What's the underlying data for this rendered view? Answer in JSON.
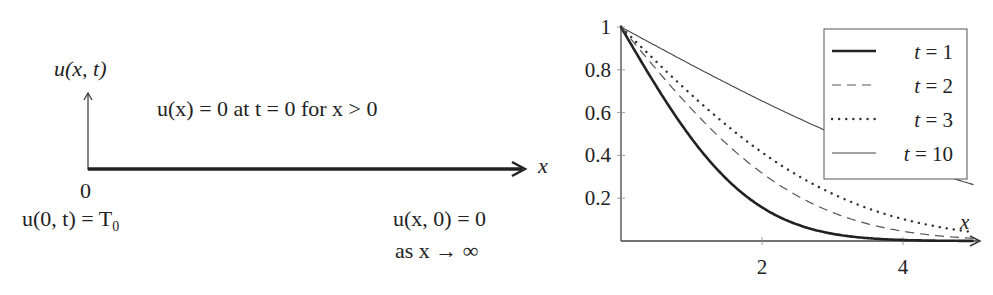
{
  "diagram": {
    "y_axis_label": "u(x, t)",
    "x_axis_label": "x",
    "origin_label": "0",
    "initial_condition": "u(x) = 0 at t = 0 for x > 0",
    "boundary_left": "u(0, t) = T",
    "boundary_left_sub": "0",
    "boundary_right_line1": "u(x, 0) = 0",
    "boundary_right_line2": "as x → ∞"
  },
  "chart_data": {
    "type": "line",
    "title": "",
    "xlabel": "x",
    "ylabel": "",
    "xlim": [
      0,
      5
    ],
    "ylim": [
      0,
      1
    ],
    "xticks": [
      2,
      4
    ],
    "yticks": [
      0.2,
      0.4,
      0.6,
      0.8,
      1
    ],
    "ytick_labels": [
      "0.2",
      "0.4",
      "0.6",
      "0.8",
      "1"
    ],
    "xtick_labels": [
      "2",
      "4"
    ],
    "grid": false,
    "legend_position": "upper right",
    "x": [
      0,
      0.5,
      1,
      1.5,
      2,
      2.5,
      3,
      3.5,
      4,
      4.5,
      5
    ],
    "series": [
      {
        "name": "t = 1",
        "style": "solid-thick",
        "values": [
          1.0,
          0.72,
          0.48,
          0.29,
          0.16,
          0.077,
          0.034,
          0.013,
          0.005,
          0.001,
          0.0004
        ]
      },
      {
        "name": "t = 2",
        "style": "dashed",
        "values": [
          1.0,
          0.8,
          0.62,
          0.45,
          0.32,
          0.21,
          0.13,
          0.08,
          0.05,
          0.02,
          0.01
        ]
      },
      {
        "name": "t = 3",
        "style": "dotted",
        "values": [
          1.0,
          0.84,
          0.68,
          0.54,
          0.41,
          0.31,
          0.22,
          0.15,
          0.1,
          0.07,
          0.04
        ]
      },
      {
        "name": "t = 10",
        "style": "solid-thin",
        "values": [
          1.0,
          0.91,
          0.82,
          0.74,
          0.65,
          0.57,
          0.5,
          0.43,
          0.37,
          0.31,
          0.26
        ]
      }
    ],
    "legend": [
      "t = 1",
      "t = 2",
      "t = 3",
      "t = 10"
    ]
  }
}
